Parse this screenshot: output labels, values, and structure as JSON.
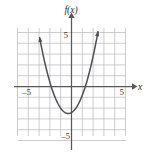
{
  "figure": {
    "kind": "cartesian-graph",
    "width": 146,
    "height": 154,
    "background_color": "#ffffff",
    "grid_color": "#b9b9bd",
    "axis_color": "#58585c",
    "curve_color": "#4f4f54"
  },
  "labels": {
    "function_label": "f(x)",
    "x_axis_label": "x",
    "x_tick_left": "–5",
    "x_tick_right": "5",
    "y_tick_top": "5",
    "y_tick_bottom": "–5"
  },
  "chart_data": {
    "type": "line",
    "title": "",
    "xlabel": "x",
    "ylabel": "f(x)",
    "xlim": [
      -5,
      5
    ],
    "ylim": [
      -5,
      5
    ],
    "grid": true,
    "grid_step": 1,
    "legend": "none",
    "axis_arrows": [
      "x-positive",
      "y-positive"
    ],
    "curve_arrows": [
      "upper-left-endpoint",
      "upper-right-endpoint"
    ],
    "series": [
      {
        "name": "f(x)",
        "shape": "parabola",
        "opens": "up",
        "vertex": [
          -0.3,
          -2.5
        ],
        "equation": "f(x) = x^2 + 0.6x - 2.41",
        "x": [
          -2.8,
          -2.6,
          -2.4,
          -2.2,
          -2.0,
          -1.8,
          -1.6,
          -1.4,
          -1.2,
          -1.0,
          -0.8,
          -0.6,
          -0.4,
          -0.2,
          0.0,
          0.2,
          0.4,
          0.6,
          0.8,
          1.0,
          1.2,
          1.4,
          1.6,
          1.8,
          2.0,
          2.2
        ],
        "y": [
          5.12,
          3.99,
          2.93,
          1.95,
          1.03,
          0.19,
          -0.59,
          -1.29,
          -1.93,
          -2.49,
          -2.98,
          -2.41,
          -2.49,
          -2.49,
          -2.41,
          -2.25,
          -2.01,
          -1.69,
          -1.29,
          -0.81,
          -0.25,
          0.39,
          1.11,
          1.91,
          2.79,
          3.75
        ]
      }
    ]
  },
  "geometry": {
    "grid_left_px": 18,
    "grid_right_px": 126,
    "grid_top_px": 28,
    "grid_bottom_px": 136,
    "origin_x_px": 71.5,
    "origin_y_px": 86.5,
    "unit_px": 10.8
  }
}
